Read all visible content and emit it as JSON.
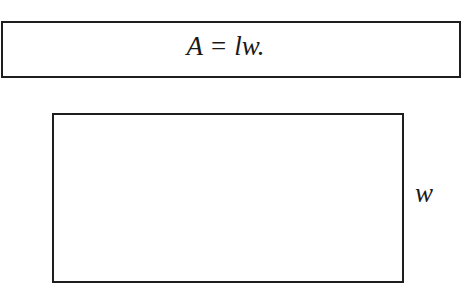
{
  "formula": {
    "text": "A = lw."
  },
  "diagram": {
    "shape": "rectangle",
    "width_label": "w"
  }
}
